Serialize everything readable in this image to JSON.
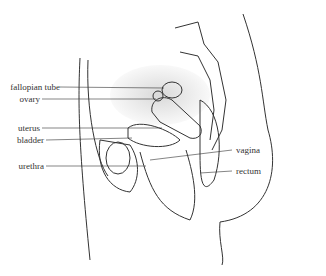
{
  "diagram": {
    "labels_left": [
      {
        "text": "fallopian tube",
        "y": 83
      },
      {
        "text": "ovary",
        "y": 95
      },
      {
        "text": "uterus",
        "y": 124
      },
      {
        "text": "bladder",
        "y": 136
      },
      {
        "text": "urethra",
        "y": 162
      }
    ],
    "labels_right": [
      {
        "text": "vagina",
        "y": 150
      },
      {
        "text": "rectum",
        "y": 171
      }
    ],
    "colors": {
      "ink": "#333333",
      "background": "#ffffff",
      "shade": "#bdbdbd"
    }
  }
}
